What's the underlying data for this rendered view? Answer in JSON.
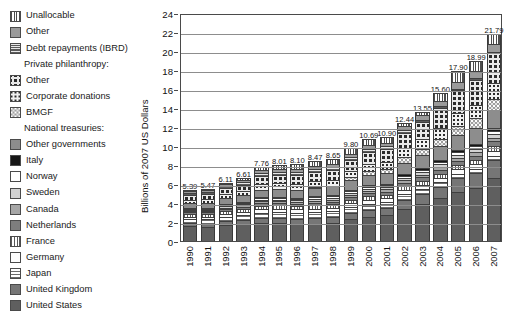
{
  "legend": {
    "items": [
      {
        "label": "Unallocable",
        "pattern": "vertical-stripes",
        "group": false
      },
      {
        "label": "Other",
        "pattern": "solid-medium-gray",
        "group": false
      },
      {
        "label": "Debt repayments (IBRD)",
        "pattern": "horizontal-stripes",
        "group": false
      },
      {
        "label": "Private philanthropy:",
        "pattern": null,
        "group": true
      },
      {
        "label": "Other",
        "pattern": "large-dots",
        "group": false
      },
      {
        "label": "Corporate donations",
        "pattern": "small-dots",
        "group": false
      },
      {
        "label": "BMGF",
        "pattern": "ring-dots",
        "group": false
      },
      {
        "label": "National treasuries:",
        "pattern": null,
        "group": true
      },
      {
        "label": "Other governments",
        "pattern": "solid-gray",
        "group": false
      },
      {
        "label": "Italy",
        "pattern": "solid-black",
        "group": false
      },
      {
        "label": "Norway",
        "pattern": "solid-white",
        "group": false
      },
      {
        "label": "Sweden",
        "pattern": "solid-light-gray",
        "group": false
      },
      {
        "label": "Canada",
        "pattern": "solid-mid-gray",
        "group": false
      },
      {
        "label": "Netherlands",
        "pattern": "solid-dark-gray",
        "group": false
      },
      {
        "label": "France",
        "pattern": "fine-vertical-stripes",
        "group": false
      },
      {
        "label": "Germany",
        "pattern": "solid-white-2",
        "group": false
      },
      {
        "label": "Japan",
        "pattern": "dashed-horizontal",
        "group": false
      },
      {
        "label": "United Kingdom",
        "pattern": "solid-uk-gray",
        "group": false
      },
      {
        "label": "United States",
        "pattern": "solid-us-gray",
        "group": false
      }
    ]
  },
  "chart_data": {
    "type": "bar",
    "subtype": "stacked-vertical",
    "title": "",
    "xlabel": "",
    "ylabel": "Billions of 2007 US Dollars",
    "ylim": [
      0,
      24
    ],
    "yticks": [
      0,
      2,
      4,
      6,
      8,
      10,
      12,
      14,
      16,
      18,
      20,
      22,
      24
    ],
    "grid": true,
    "legend_position": "left-outside",
    "categories": [
      "1990",
      "1991",
      "1992",
      "1993",
      "1994",
      "1995",
      "1996",
      "1997",
      "1998",
      "1999",
      "2000",
      "2001",
      "2002",
      "2003",
      "2004",
      "2005",
      "2006",
      "2007"
    ],
    "totals": [
      5.39,
      5.47,
      6.11,
      6.61,
      7.76,
      8.01,
      8.1,
      8.47,
      8.65,
      9.8,
      10.69,
      10.9,
      12.44,
      13.55,
      15.6,
      17.9,
      18.99,
      21.79
    ],
    "total_labels": [
      "5.39",
      "5.47",
      "6.11",
      "6.61",
      "7.76",
      "8.01",
      "8.10",
      "8.47",
      "8.65",
      "9.80",
      "10.69",
      "10.90",
      "12.44",
      "13.55",
      "15.60",
      "17.90",
      "18.99",
      "21.79"
    ],
    "series": [
      {
        "name": "United States",
        "pattern": "solid-us-gray",
        "values": [
          1.55,
          1.52,
          1.7,
          1.78,
          1.92,
          1.88,
          1.78,
          1.82,
          1.92,
          2.3,
          2.62,
          2.8,
          3.42,
          3.92,
          4.78,
          5.62,
          6.05,
          7.1
        ]
      },
      {
        "name": "United Kingdom",
        "pattern": "solid-uk-gray",
        "values": [
          0.3,
          0.32,
          0.36,
          0.4,
          0.46,
          0.5,
          0.52,
          0.56,
          0.58,
          0.66,
          0.74,
          0.78,
          0.92,
          1.06,
          1.3,
          1.58,
          1.7,
          2.05
        ]
      },
      {
        "name": "Japan",
        "pattern": "dashed-horizontal",
        "values": [
          0.42,
          0.44,
          0.5,
          0.54,
          0.62,
          0.64,
          0.66,
          0.66,
          0.64,
          0.66,
          0.66,
          0.62,
          0.6,
          0.56,
          0.52,
          0.5,
          0.46,
          0.44
        ]
      },
      {
        "name": "Germany",
        "pattern": "solid-white-2",
        "values": [
          0.3,
          0.3,
          0.32,
          0.34,
          0.38,
          0.38,
          0.38,
          0.38,
          0.38,
          0.4,
          0.42,
          0.42,
          0.44,
          0.46,
          0.5,
          0.54,
          0.56,
          0.62
        ]
      },
      {
        "name": "France",
        "pattern": "fine-vertical-stripes",
        "values": [
          0.26,
          0.26,
          0.28,
          0.3,
          0.34,
          0.34,
          0.34,
          0.34,
          0.34,
          0.36,
          0.36,
          0.36,
          0.38,
          0.4,
          0.44,
          0.48,
          0.5,
          0.54
        ]
      },
      {
        "name": "Netherlands",
        "pattern": "solid-dark-gray",
        "values": [
          0.18,
          0.18,
          0.2,
          0.22,
          0.26,
          0.26,
          0.26,
          0.28,
          0.28,
          0.3,
          0.32,
          0.32,
          0.34,
          0.36,
          0.4,
          0.44,
          0.46,
          0.5
        ]
      },
      {
        "name": "Canada",
        "pattern": "solid-mid-gray",
        "values": [
          0.14,
          0.14,
          0.16,
          0.16,
          0.2,
          0.2,
          0.2,
          0.22,
          0.22,
          0.24,
          0.26,
          0.26,
          0.28,
          0.3,
          0.34,
          0.38,
          0.4,
          0.44
        ]
      },
      {
        "name": "Sweden",
        "pattern": "solid-light-gray",
        "values": [
          0.12,
          0.12,
          0.14,
          0.14,
          0.16,
          0.16,
          0.16,
          0.18,
          0.18,
          0.2,
          0.22,
          0.22,
          0.24,
          0.26,
          0.3,
          0.34,
          0.36,
          0.4
        ]
      },
      {
        "name": "Norway",
        "pattern": "solid-white",
        "values": [
          0.1,
          0.1,
          0.12,
          0.12,
          0.14,
          0.14,
          0.14,
          0.16,
          0.16,
          0.18,
          0.2,
          0.2,
          0.22,
          0.24,
          0.28,
          0.32,
          0.34,
          0.38
        ]
      },
      {
        "name": "Italy",
        "pattern": "solid-black",
        "values": [
          0.1,
          0.1,
          0.1,
          0.12,
          0.14,
          0.14,
          0.14,
          0.14,
          0.14,
          0.16,
          0.16,
          0.16,
          0.18,
          0.2,
          0.22,
          0.26,
          0.28,
          0.3
        ]
      },
      {
        "name": "Other governments",
        "pattern": "solid-gray",
        "values": [
          0.52,
          0.55,
          0.62,
          0.68,
          0.78,
          0.82,
          0.84,
          0.88,
          0.9,
          1.0,
          1.08,
          1.1,
          1.24,
          1.34,
          1.52,
          1.72,
          1.8,
          2.02
        ]
      },
      {
        "name": "BMGF",
        "pattern": "ring-dots",
        "values": [
          0.0,
          0.0,
          0.0,
          0.0,
          0.0,
          0.0,
          0.0,
          0.02,
          0.04,
          0.3,
          0.42,
          0.44,
          0.56,
          0.68,
          0.82,
          1.0,
          1.1,
          1.3
        ]
      },
      {
        "name": "Corporate donations",
        "pattern": "small-dots",
        "values": [
          0.36,
          0.38,
          0.42,
          0.46,
          0.58,
          0.6,
          0.62,
          0.64,
          0.66,
          0.72,
          0.8,
          0.82,
          0.96,
          1.06,
          1.24,
          1.46,
          1.56,
          1.8
        ]
      },
      {
        "name": "Private philanthropy - Other",
        "pattern": "large-dots",
        "values": [
          0.52,
          0.54,
          0.62,
          0.68,
          0.88,
          0.92,
          0.96,
          1.02,
          1.04,
          1.16,
          1.32,
          1.36,
          1.62,
          1.82,
          2.2,
          2.64,
          2.86,
          3.36
        ]
      },
      {
        "name": "Debt repayments (IBRD)",
        "pattern": "horizontal-stripes",
        "values": [
          0.22,
          0.22,
          0.24,
          0.26,
          0.3,
          0.3,
          0.3,
          0.3,
          0.3,
          0.3,
          0.3,
          0.28,
          0.26,
          0.24,
          0.22,
          0.2,
          0.18,
          0.16
        ]
      },
      {
        "name": "Other",
        "pattern": "solid-medium-gray",
        "values": [
          0.2,
          0.2,
          0.22,
          0.24,
          0.28,
          0.3,
          0.3,
          0.32,
          0.32,
          0.36,
          0.4,
          0.42,
          0.48,
          0.54,
          0.62,
          0.72,
          0.78,
          0.88
        ]
      },
      {
        "name": "Unallocable",
        "pattern": "vertical-stripes",
        "values": [
          0.1,
          0.1,
          0.11,
          0.17,
          0.32,
          0.43,
          0.5,
          0.55,
          0.55,
          0.6,
          0.61,
          0.54,
          0.3,
          0.25,
          0.9,
          1.3,
          1.2,
          1.1
        ]
      }
    ]
  }
}
